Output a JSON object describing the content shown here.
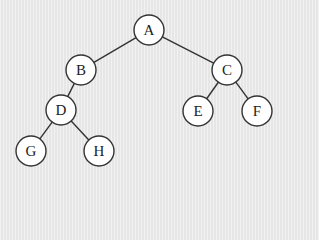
{
  "diagram": {
    "type": "binary-tree",
    "colors": {
      "background": "#ebebeb",
      "node_fill": "#ffffff",
      "node_stroke": "#333333",
      "edge": "#333333",
      "text": "#222222"
    },
    "node_radius": 15,
    "nodes": [
      {
        "id": "A",
        "label": "A",
        "x": 149,
        "y": 30
      },
      {
        "id": "B",
        "label": "B",
        "x": 81,
        "y": 70
      },
      {
        "id": "C",
        "label": "C",
        "x": 227,
        "y": 70
      },
      {
        "id": "D",
        "label": "D",
        "x": 61,
        "y": 110
      },
      {
        "id": "E",
        "label": "E",
        "x": 198,
        "y": 111
      },
      {
        "id": "F",
        "label": "F",
        "x": 257,
        "y": 111
      },
      {
        "id": "G",
        "label": "G",
        "x": 31,
        "y": 151
      },
      {
        "id": "H",
        "label": "H",
        "x": 99,
        "y": 151
      }
    ],
    "edges": [
      {
        "from": "A",
        "to": "B"
      },
      {
        "from": "A",
        "to": "C"
      },
      {
        "from": "B",
        "to": "D"
      },
      {
        "from": "C",
        "to": "E"
      },
      {
        "from": "C",
        "to": "F"
      },
      {
        "from": "D",
        "to": "G"
      },
      {
        "from": "D",
        "to": "H"
      }
    ]
  }
}
